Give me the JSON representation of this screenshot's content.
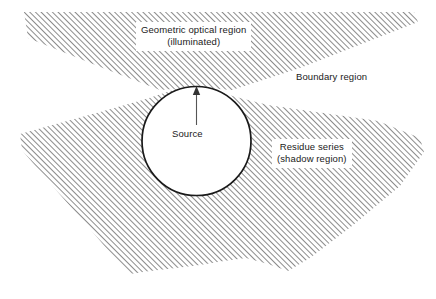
{
  "figure": {
    "width": 436,
    "height": 299,
    "background_color": "#ffffff",
    "stroke_color": "#1a1a1a",
    "hatch_color": "#4d4d4d",
    "hatch_angle_deg": 45,
    "hatch_spacing_px": 4
  },
  "labels": {
    "geometric_line1": "Geometric optical region",
    "geometric_line2": "(illuminated)",
    "boundary": "Boundary region",
    "residue_line1": "Residue series",
    "residue_line2": "(shadow region)",
    "source": "Source"
  },
  "shapes": {
    "source_circle": {
      "cx": 196.5,
      "cy": 141,
      "r": 54.5,
      "fill": "#ffffff",
      "stroke": "#1a1a1a",
      "stroke_width": 1.6
    },
    "illuminated_wedge": {
      "name": "geometric-optical-region",
      "description": "upper hatched wedge converging to top of circle"
    },
    "shadow_region": {
      "name": "residue-series-shadow-region",
      "description": "lower hatched region surrounding and below circle"
    },
    "source_arrow": {
      "from_x": 196.5,
      "from_y": 124,
      "to_x": 196.5,
      "to_y": 89,
      "stroke": "#4d4d4d"
    }
  }
}
